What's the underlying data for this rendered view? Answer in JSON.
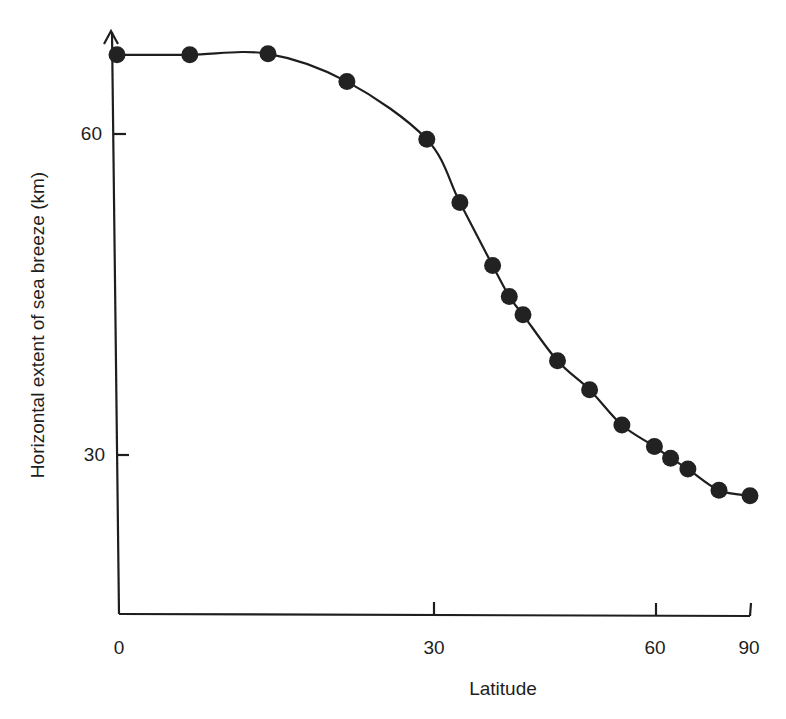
{
  "chart_data": {
    "type": "line",
    "title": "",
    "xlabel": "Latitude",
    "ylabel": "Horizontal extent of sea breeze (km)",
    "x_scale": "sin(latitude)",
    "xlim": [
      0,
      90
    ],
    "ylim": [
      15,
      70
    ],
    "grid": false,
    "legend": null,
    "x_ticks": [
      0,
      30,
      60,
      90
    ],
    "y_ticks": [
      30,
      60
    ],
    "series": [
      {
        "name": "Horizontal extent of sea breeze",
        "marker": "filled-circle",
        "line": "smooth",
        "x": [
          0,
          6.6,
          13.8,
          21.3,
          29.3,
          32.8,
          36.4,
          38.3,
          39.9,
          44.1,
          48.3,
          52.9,
          58.1,
          61.0,
          64.4,
          72.0,
          90
        ],
        "y": [
          67.4,
          67.4,
          67.5,
          64.9,
          59.5,
          53.6,
          47.7,
          44.8,
          43.1,
          38.8,
          36.1,
          32.8,
          30.8,
          29.7,
          28.7,
          26.7,
          26.2
        ]
      }
    ]
  },
  "labels": {
    "x_ticks": [
      "0",
      "30",
      "60",
      "90"
    ],
    "y_ticks": [
      "60",
      "30"
    ],
    "xlabel": "Latitude",
    "ylabel": "Horizontal extent of sea breeze (km)"
  },
  "style": {
    "ink_color": "#1e1e1e",
    "background": "#ffffff"
  }
}
